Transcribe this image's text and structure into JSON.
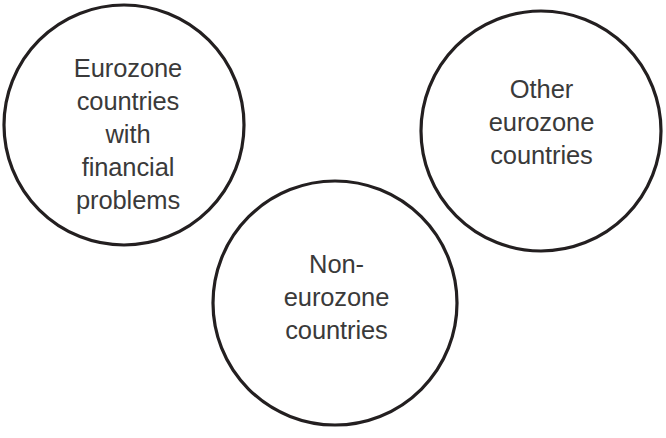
{
  "diagram": {
    "type": "venn-like-circles",
    "canvas": {
      "width": 666,
      "height": 438,
      "background": "#ffffff"
    },
    "stroke_color": "#231f20",
    "text_color": "#3a3a3a",
    "nodes": [
      {
        "id": "eurozone-problems",
        "label": "Eurozone\ncountries\nwith\nfinancial\nproblems",
        "lines": [
          "Eurozone",
          "countries",
          "with",
          "financial",
          "problems"
        ],
        "center_x": 124,
        "center_y": 125,
        "radius": 120
      },
      {
        "id": "other-eurozone",
        "label": "Other\neurozone\ncountries",
        "lines": [
          "Other",
          "eurozone",
          "countries"
        ],
        "center_x": 541,
        "center_y": 131,
        "radius": 120
      },
      {
        "id": "non-eurozone",
        "label": "Non-\neurozone\ncountries",
        "lines": [
          "Non-",
          "eurozone",
          "countries"
        ],
        "center_x": 335,
        "center_y": 303,
        "radius": 122
      }
    ]
  }
}
